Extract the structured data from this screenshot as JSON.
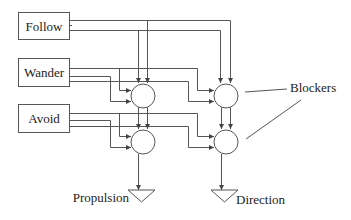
{
  "diagram": {
    "type": "behavior-arbitration-network",
    "behaviors": [
      {
        "label": "Follow"
      },
      {
        "label": "Wander"
      },
      {
        "label": "Avoid"
      }
    ],
    "annotation": {
      "label": "Blockers"
    },
    "outputs": [
      {
        "label": "Propulsion"
      },
      {
        "label": "Direction"
      }
    ],
    "colors": {
      "stroke": "#555555",
      "text": "#222222",
      "background": "#ffffff"
    }
  }
}
